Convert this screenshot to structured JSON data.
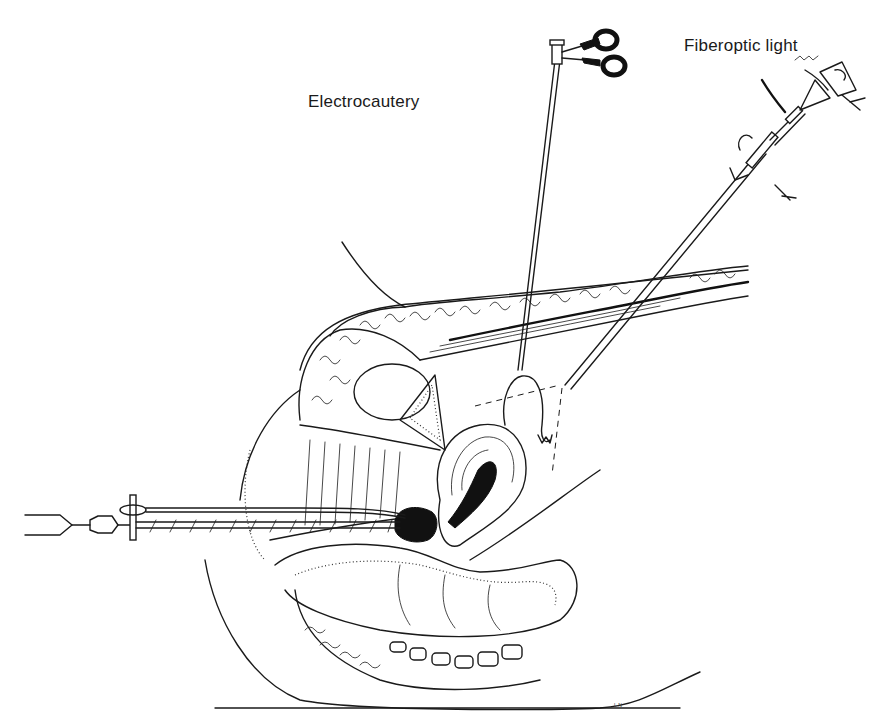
{
  "labels": {
    "electrocautery": "Electrocautery",
    "fiberoptic_light": "Fiberoptic light"
  },
  "signature": "L.N",
  "colors": {
    "ink": "#1a1a1a",
    "background": "#ffffff"
  }
}
